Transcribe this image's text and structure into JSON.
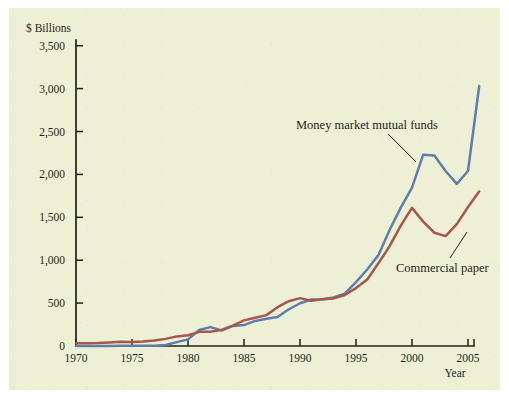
{
  "figure": {
    "background_color": "#eef0d6",
    "outer_color": "#ffffff",
    "ink_color": "#231f18"
  },
  "chart_data": {
    "type": "line",
    "title": "",
    "subtitle": "",
    "xlabel": "Year",
    "ylabel": "$ Billions",
    "xlim": [
      1970,
      2006.5
    ],
    "ylim": [
      0,
      3500
    ],
    "grid": false,
    "legend_position": "inline-annotations",
    "x_ticks": [
      1970,
      1975,
      1980,
      1985,
      1990,
      1995,
      2000,
      2005
    ],
    "x_tick_labels": [
      "1970",
      "1975",
      "1980",
      "1985",
      "1990",
      "1995",
      "2000",
      "2005"
    ],
    "y_ticks": [
      0,
      500,
      1000,
      1500,
      2000,
      2500,
      3000,
      3500
    ],
    "y_tick_labels": [
      "0",
      "500",
      "1,000",
      "1,500",
      "2,000",
      "2,500",
      "3,000",
      "3,500"
    ],
    "x": [
      1970,
      1971,
      1972,
      1973,
      1974,
      1975,
      1976,
      1977,
      1978,
      1979,
      1980,
      1981,
      1982,
      1983,
      1984,
      1985,
      1986,
      1987,
      1988,
      1989,
      1990,
      1991,
      1992,
      1993,
      1994,
      1995,
      1996,
      1997,
      1998,
      1999,
      2000,
      2001,
      2002,
      2003,
      2004,
      2005,
      2006
    ],
    "series": [
      {
        "name": "Money market mutual funds",
        "color": "#5c7fab",
        "values": [
          0,
          0,
          0,
          0,
          2,
          4,
          4,
          4,
          11,
          45,
          77,
          186,
          220,
          180,
          234,
          244,
          292,
          317,
          339,
          428,
          498,
          542,
          546,
          565,
          611,
          745,
          892,
          1059,
          1352,
          1613,
          1845,
          2230,
          2220,
          2040,
          1890,
          2040,
          3030
        ]
      },
      {
        "name": "Commercial paper",
        "color": "#a6574a",
        "values": [
          33,
          32,
          34,
          41,
          49,
          48,
          53,
          65,
          83,
          112,
          125,
          165,
          166,
          188,
          238,
          299,
          330,
          360,
          452,
          522,
          558,
          528,
          546,
          555,
          595,
          675,
          775,
          965,
          1163,
          1402,
          1610,
          1450,
          1320,
          1280,
          1420,
          1620,
          1800
        ]
      }
    ],
    "annotations": [
      {
        "text": "Money market mutual funds",
        "series": "Money market mutual funds",
        "text_x": 296,
        "text_y": 129,
        "leader_from_x": 388,
        "leader_from_y": 134,
        "leader_to_x": 416,
        "leader_to_y": 162
      },
      {
        "text": "Commercial paper",
        "series": "Commercial paper",
        "text_x": 396,
        "text_y": 272,
        "leader_from_x": 450,
        "leader_from_y": 258,
        "leader_to_x": 467,
        "leader_to_y": 232
      }
    ]
  },
  "geometry": {
    "origin_x": 76,
    "origin_y": 346,
    "axis_top_y": 40,
    "axis_right_x": 474,
    "px_per_year": 11.2,
    "px_per_500": 42.9
  },
  "labels": {
    "y_axis_title": "$ Billions",
    "x_axis_title": "Year"
  }
}
